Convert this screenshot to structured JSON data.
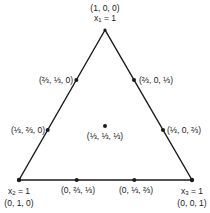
{
  "diagram": {
    "type": "ternary-simplex",
    "stroke_color": "#1a1a1a",
    "vertices": {
      "top": {
        "coord": "(1, 0, 0)",
        "var_label": "x",
        "var_sub": "1",
        "var_eq": " = 1"
      },
      "bottom_left": {
        "coord": "(0, 1, 0)",
        "var_label": "x",
        "var_sub": "2",
        "var_eq": " = 1"
      },
      "bottom_right": {
        "coord": "(0, 0, 1)",
        "var_label": "x",
        "var_sub": "3",
        "var_eq": " = 1"
      }
    },
    "edge_points": {
      "left_upper": "(⅔, ⅓, 0)",
      "left_lower": "(⅓, ⅔, 0)",
      "right_upper": "(⅔, 0, ⅓)",
      "right_lower": "(⅓, 0, ⅔)",
      "bottom_left": "(0, ⅔, ⅓)",
      "bottom_right": "(0, ⅓, ⅔)"
    },
    "centroid": "(⅓, ⅓, ⅓)"
  }
}
